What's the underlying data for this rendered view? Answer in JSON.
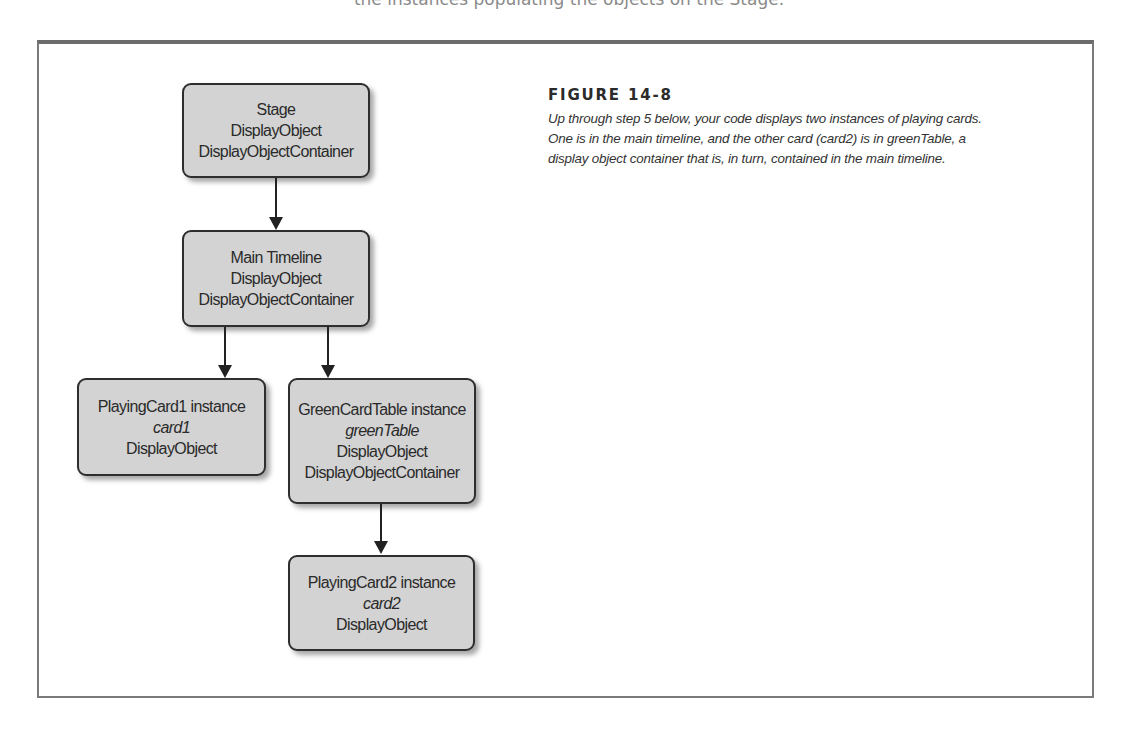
{
  "page": {
    "cut_off_line": "the instances populating the objects on the Stage."
  },
  "figure": {
    "label": "FIGURE 14-8",
    "caption_lines": [
      "Up through step 5 below, your code displays two instances of playing cards.",
      "One is in the main timeline, and the other card (card2) is in greenTable, a",
      "display object container that is, in turn, contained in the main timeline."
    ]
  },
  "diagram": {
    "nodes": {
      "stage": {
        "line1": "Stage",
        "line2": "DisplayObject",
        "line3": "DisplayObjectContainer"
      },
      "main_timeline": {
        "line1": "Main Timeline",
        "line2": "DisplayObject",
        "line3": "DisplayObjectContainer"
      },
      "playing_card1": {
        "line1": "PlayingCard1 instance",
        "instance_name": "card1",
        "line3": "DisplayObject"
      },
      "green_card_table": {
        "line1": "GreenCardTable instance",
        "instance_name": "greenTable",
        "line3": "DisplayObject",
        "line4": "DisplayObjectContainer"
      },
      "playing_card2": {
        "line1": "PlayingCard2 instance",
        "instance_name": "card2",
        "line3": "DisplayObject"
      }
    },
    "edges": [
      {
        "from": "stage",
        "to": "main_timeline"
      },
      {
        "from": "main_timeline",
        "to": "playing_card1"
      },
      {
        "from": "main_timeline",
        "to": "green_card_table"
      },
      {
        "from": "green_card_table",
        "to": "playing_card2"
      }
    ],
    "colors": {
      "node_fill": "#d3d3d3",
      "node_border": "#2e2e2e",
      "arrow": "#222222",
      "frame": "#7a7a7a"
    }
  }
}
